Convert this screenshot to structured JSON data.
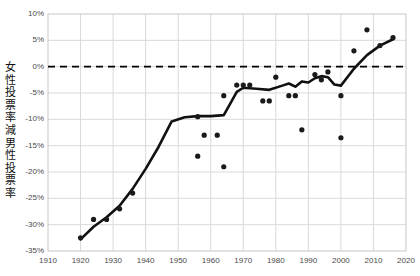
{
  "chart_data": {
    "type": "scatter",
    "title": "",
    "xlabel": "",
    "ylabel": "女性投票率減男性投票率",
    "xlim": [
      1910,
      2020
    ],
    "ylim": [
      -35,
      10
    ],
    "grid": true,
    "legend": null,
    "x_ticks": [
      "1910",
      "1920",
      "1930",
      "1940",
      "1950",
      "1960",
      "1970",
      "1980",
      "1990",
      "2000",
      "2010",
      "2020"
    ],
    "y_ticks": [
      "10%",
      "5%",
      "0%",
      "-5%",
      "-10%",
      "-15%",
      "-20%",
      "-25%",
      "-30%",
      "-35%"
    ],
    "y_tick_values": [
      10,
      5,
      0,
      -5,
      -10,
      -15,
      -20,
      -25,
      -30,
      -35
    ],
    "x_tick_values": [
      1910,
      1920,
      1930,
      1940,
      1950,
      1960,
      1970,
      1980,
      1990,
      2000,
      2010,
      2020
    ],
    "reference_line": {
      "y": 0,
      "style": "dashed",
      "color": "#000000"
    },
    "series": [
      {
        "name": "scatter-points",
        "type": "scatter",
        "marker": "circle",
        "color": "#1a1a1a",
        "points": [
          {
            "x": 1920,
            "y": -32.5
          },
          {
            "x": 1924,
            "y": -29.0
          },
          {
            "x": 1928,
            "y": -29.0
          },
          {
            "x": 1932,
            "y": -27.0
          },
          {
            "x": 1936,
            "y": -24.0
          },
          {
            "x": 1956,
            "y": -9.5
          },
          {
            "x": 1956,
            "y": -17.0
          },
          {
            "x": 1958,
            "y": -13.0
          },
          {
            "x": 1962,
            "y": -13.0
          },
          {
            "x": 1964,
            "y": -19.0
          },
          {
            "x": 1964,
            "y": -5.5
          },
          {
            "x": 1968,
            "y": -3.5
          },
          {
            "x": 1970,
            "y": -3.5
          },
          {
            "x": 1972,
            "y": -3.5
          },
          {
            "x": 1976,
            "y": -6.5
          },
          {
            "x": 1978,
            "y": -6.5
          },
          {
            "x": 1980,
            "y": -2.0
          },
          {
            "x": 1984,
            "y": -5.5
          },
          {
            "x": 1986,
            "y": -5.5
          },
          {
            "x": 1988,
            "y": -12.0
          },
          {
            "x": 1992,
            "y": -1.5
          },
          {
            "x": 1994,
            "y": -2.5
          },
          {
            "x": 1996,
            "y": -1.0
          },
          {
            "x": 2000,
            "y": -5.5
          },
          {
            "x": 2000,
            "y": -13.5
          },
          {
            "x": 2004,
            "y": 3.0
          },
          {
            "x": 2008,
            "y": 7.0
          },
          {
            "x": 2012,
            "y": 4.0
          },
          {
            "x": 2016,
            "y": 5.5
          }
        ]
      },
      {
        "name": "trend-line",
        "type": "line",
        "color": "#111111",
        "points": [
          {
            "x": 1920,
            "y": -32.8
          },
          {
            "x": 1924,
            "y": -30.4
          },
          {
            "x": 1928,
            "y": -28.6
          },
          {
            "x": 1932,
            "y": -26.4
          },
          {
            "x": 1936,
            "y": -23.2
          },
          {
            "x": 1940,
            "y": -19.4
          },
          {
            "x": 1944,
            "y": -15.2
          },
          {
            "x": 1948,
            "y": -10.4
          },
          {
            "x": 1952,
            "y": -9.6
          },
          {
            "x": 1956,
            "y": -9.4
          },
          {
            "x": 1960,
            "y": -9.4
          },
          {
            "x": 1964,
            "y": -9.2
          },
          {
            "x": 1966,
            "y": -7.0
          },
          {
            "x": 1968,
            "y": -4.8
          },
          {
            "x": 1970,
            "y": -4.0
          },
          {
            "x": 1974,
            "y": -4.2
          },
          {
            "x": 1978,
            "y": -4.4
          },
          {
            "x": 1982,
            "y": -3.6
          },
          {
            "x": 1984,
            "y": -3.2
          },
          {
            "x": 1986,
            "y": -3.8
          },
          {
            "x": 1988,
            "y": -2.8
          },
          {
            "x": 1990,
            "y": -3.0
          },
          {
            "x": 1992,
            "y": -2.2
          },
          {
            "x": 1994,
            "y": -1.8
          },
          {
            "x": 1996,
            "y": -2.0
          },
          {
            "x": 1998,
            "y": -3.4
          },
          {
            "x": 2000,
            "y": -3.6
          },
          {
            "x": 2004,
            "y": -0.4
          },
          {
            "x": 2008,
            "y": 2.2
          },
          {
            "x": 2012,
            "y": 4.0
          },
          {
            "x": 2016,
            "y": 5.2
          }
        ]
      }
    ]
  }
}
